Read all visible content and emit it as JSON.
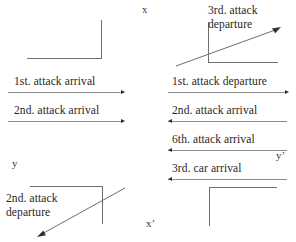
{
  "diagram": {
    "axis_labels": [
      {
        "name": "x",
        "text": "x",
        "x": 142,
        "y": 4
      },
      {
        "name": "y",
        "text": "y",
        "x": 12,
        "y": 158
      },
      {
        "name": "x-prime",
        "text": "x’",
        "x": 146,
        "y": 218
      },
      {
        "name": "y-prime",
        "text": "y’",
        "x": 276,
        "y": 150
      }
    ],
    "left_column": {
      "events": [
        {
          "label": "1st. attack arrival",
          "direction": "right"
        },
        {
          "label": "2nd. attack arrival",
          "direction": "right"
        }
      ],
      "corner_note": "2nd. attack departure",
      "corner_note_lines": [
        "2nd. attack",
        "departure"
      ]
    },
    "right_column": {
      "events": [
        {
          "label": "1st. attack departure",
          "direction": "right"
        },
        {
          "label": "2nd. attack arrival",
          "direction": "left"
        },
        {
          "label": "6th. attack arrival",
          "direction": "left"
        },
        {
          "label": "3rd. car arrival",
          "direction": "left"
        }
      ],
      "corner_note": "3rd. attack departure",
      "corner_note_lines": [
        "3rd. attack",
        "departure"
      ]
    },
    "colors": {
      "stroke": "#6f6f6f",
      "lifeline": "#8e8e8e",
      "text": "#1f1f1f",
      "arrow": "#2f2f2f",
      "background": "#ffffff"
    }
  }
}
